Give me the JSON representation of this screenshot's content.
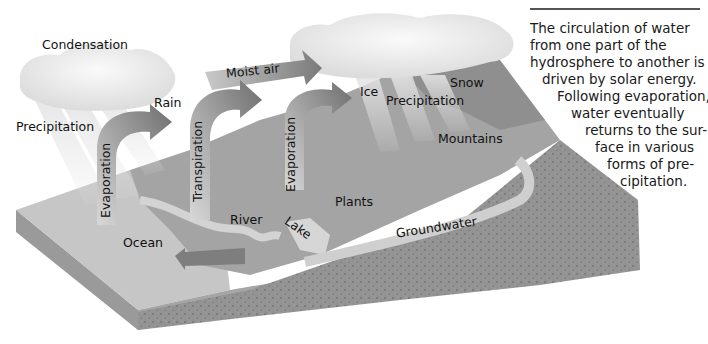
{
  "figure": {
    "palette": {
      "background": "#ffffff",
      "cloud": "#ececec",
      "arrow": "#8a8a8a",
      "ocean_top": "#c8c8c8",
      "ocean_side": "#9e9e9e",
      "land": "#a3a3a3",
      "bedrock": "#8f8f8f",
      "water_channel": "#d6d6d6",
      "text": "#111111"
    }
  },
  "labels": {
    "condensation": "Condensation",
    "precipitation_left": "Precipitation",
    "rain": "Rain",
    "moist_air": "Moist air",
    "ice": "Ice",
    "precipitation_right": "Precipitation",
    "snow": "Snow",
    "mountains": "Mountains",
    "evaporation_left": "Evaporation",
    "transpiration": "Transpiration",
    "evaporation_middle": "Evaporation",
    "plants": "Plants",
    "river": "River",
    "lake": "Lake",
    "ocean": "Ocean",
    "groundwater": "Groundwater"
  },
  "caption": {
    "lines": [
      "The circulation of water",
      "from one part of the",
      "hydrosphere to another is",
      "driven by solar energy.",
      "Following evaporation,",
      "water eventually",
      "returns to the sur-",
      "face in various",
      "forms of pre-",
      "cipitation."
    ]
  }
}
